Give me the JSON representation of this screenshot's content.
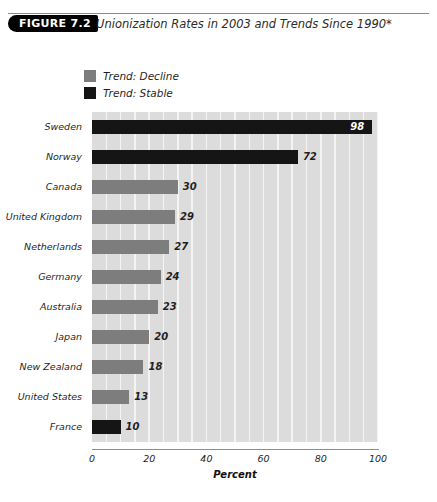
{
  "header": {
    "badge": "FIGURE 7.2",
    "title": "Unionization Rates in 2003 and Trends Since 1990*"
  },
  "legend": {
    "position": "top-left",
    "items": [
      {
        "label": "Trend: Decline",
        "color": "#7d7d7d",
        "key": "decline"
      },
      {
        "label": "Trend: Stable",
        "color": "#151515",
        "key": "stable"
      }
    ]
  },
  "colors": {
    "decline": "#7d7d7d",
    "stable": "#151515",
    "plot_background": "#dcdcdc",
    "gridline": "#f4f4f4",
    "axis": "#8d8d8d",
    "text": "#1f1f1f"
  },
  "chart_data": {
    "type": "bar",
    "orientation": "horizontal",
    "title": "Unionization Rates in 2003 and Trends Since 1990*",
    "xlabel": "Percent",
    "ylabel": "",
    "xlim": [
      0,
      100
    ],
    "xticks": [
      0,
      20,
      40,
      60,
      80,
      100
    ],
    "grid": "vertical-minor-every-5",
    "categories": [
      "Sweden",
      "Norway",
      "Canada",
      "United Kingdom",
      "Netherlands",
      "Germany",
      "Australia",
      "Japan",
      "New Zealand",
      "United States",
      "France"
    ],
    "values": [
      98,
      72,
      30,
      29,
      27,
      24,
      23,
      20,
      18,
      13,
      10
    ],
    "trends": [
      "stable",
      "stable",
      "decline",
      "decline",
      "decline",
      "decline",
      "decline",
      "decline",
      "decline",
      "decline",
      "stable"
    ],
    "data_labels": [
      "98",
      "72",
      "30",
      "29",
      "27",
      "24",
      "23",
      "20",
      "18",
      "13",
      "10"
    ],
    "legend": [
      "Trend: Decline",
      "Trend: Stable"
    ]
  }
}
